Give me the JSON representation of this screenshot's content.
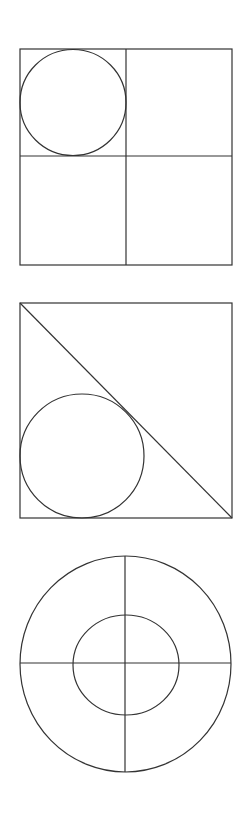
{
  "diagram": {
    "stroke_color": "#333333",
    "background": "#ffffff",
    "figures": [
      {
        "name": "square-quadrants-with-circle",
        "square": {
          "x": 20,
          "y": 49,
          "width": 212,
          "height": 216
        },
        "vertical_divider_x": 126,
        "horizontal_divider_y": 156,
        "circle": {
          "cx": 73,
          "cy": 102.5,
          "r": 53,
          "position": "inscribed in top-left quadrant"
        }
      },
      {
        "name": "square-diagonal-with-circle",
        "square": {
          "x": 20,
          "y": 303,
          "width": 212,
          "height": 215
        },
        "diagonal": {
          "x1": 20,
          "y1": 303,
          "x2": 232,
          "y2": 518
        },
        "circle": {
          "cx": 82,
          "cy": 456,
          "r": 62,
          "position": "tangent to left side, bottom side and diagonal"
        }
      },
      {
        "name": "concentric-circles-with-cross",
        "outer_ellipse": {
          "cx": 125.5,
          "cy": 664,
          "rx": 105.5,
          "ry": 108
        },
        "inner_ellipse": {
          "cx": 126,
          "cy": 665,
          "rx": 53,
          "ry": 50
        },
        "horizontal_diameter": {
          "x1": 20,
          "y1": 663,
          "x2": 231,
          "y2": 663
        },
        "vertical_diameter": {
          "x1": 125,
          "y1": 556,
          "x2": 125,
          "y2": 772
        }
      }
    ]
  }
}
